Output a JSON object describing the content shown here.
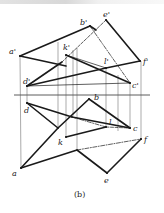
{
  "figure": {
    "caption": "(b)",
    "colors": {
      "line": "#1a1a1a",
      "thin": "#555555",
      "background": "#ffffff"
    },
    "axis_y": 95,
    "points_front": {
      "a'": [
        20,
        56
      ],
      "b'": [
        90,
        26
      ],
      "c'": [
        130,
        83
      ],
      "d'": [
        27,
        86
      ],
      "e'": [
        106,
        20
      ],
      "f'": [
        140,
        61
      ],
      "k'": [
        66,
        55
      ],
      "l'": [
        106,
        68
      ]
    },
    "points_top": {
      "a": [
        21,
        168
      ],
      "b": [
        89,
        99
      ],
      "c": [
        130,
        128
      ],
      "d": [
        27,
        103
      ],
      "e": [
        107,
        173
      ],
      "f": [
        141,
        139
      ],
      "k": [
        66,
        137
      ],
      "l": [
        106,
        127
      ]
    },
    "labels": {
      "a_prime": "a'",
      "b_prime": "b'",
      "c_prime": "c'",
      "d_prime": "d'",
      "e_prime": "e'",
      "f_prime": "f'",
      "k_prime": "k'",
      "l_prime": "l'",
      "a": "a",
      "b": "b",
      "c": "c",
      "d": "d",
      "e": "e",
      "f": "f",
      "k": "k",
      "l": "l"
    }
  }
}
